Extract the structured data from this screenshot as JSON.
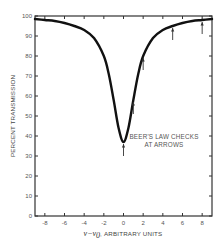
{
  "chart_data": {
    "type": "line",
    "title": "",
    "xlabel": "ν − ν₀, ARBITRARY UNITS",
    "xlabel_symbol": "ν−ν",
    "xlabel_subscript": "0",
    "xlabel_units": ", ARBITRARY UNITS",
    "ylabel": "PERCENT TRANSMISSION",
    "xlim": [
      -9,
      9
    ],
    "ylim": [
      0,
      100
    ],
    "grid": false,
    "legend": null,
    "x_ticks": [
      -8,
      -6,
      -4,
      -2,
      0,
      2,
      4,
      6,
      8
    ],
    "x_tick_labels": [
      "-8",
      "-6",
      "-4",
      "-2",
      "0",
      "2",
      "4",
      "6",
      "8"
    ],
    "y_ticks": [
      0,
      10,
      20,
      30,
      40,
      50,
      60,
      70,
      80,
      90,
      100
    ],
    "y_tick_labels": [
      "0",
      "10",
      "20",
      "30",
      "40",
      "50",
      "60",
      "70",
      "80",
      "90",
      "100"
    ],
    "series": [
      {
        "name": "Transmission",
        "x": [
          -9,
          -8,
          -7,
          -6,
          -5,
          -4,
          -3,
          -2,
          -1.5,
          -1,
          -0.5,
          0,
          0.5,
          1,
          1.5,
          2,
          3,
          4,
          5,
          6,
          7,
          8,
          9
        ],
        "values": [
          98.5,
          98,
          97.5,
          96.5,
          95,
          93,
          89,
          80,
          71,
          58,
          44,
          37,
          44,
          58,
          71,
          80,
          89,
          93,
          95,
          96.5,
          97.5,
          98,
          98.5
        ]
      }
    ],
    "arrows": [
      {
        "x": 0,
        "y": 37
      },
      {
        "x": 1,
        "y": 58
      },
      {
        "x": 2,
        "y": 80
      },
      {
        "x": 5,
        "y": 95
      },
      {
        "x": 8,
        "y": 98
      }
    ],
    "annotations": [
      "BEER'S LAW CHECKS",
      "AT ARROWS"
    ]
  }
}
